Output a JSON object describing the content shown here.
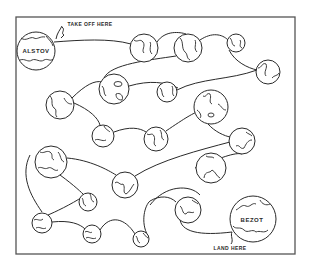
{
  "puzzle": {
    "type": "space maze",
    "start_label": "TAKE OFF HERE",
    "end_label": "LAND HERE",
    "start_planet": "ALSTOV",
    "end_planet": "BEZOT"
  },
  "planets": [
    {
      "id": "p1",
      "name": "ALSTOV",
      "role": "start"
    },
    {
      "id": "p2",
      "name": ""
    },
    {
      "id": "p3",
      "name": ""
    },
    {
      "id": "p4",
      "name": ""
    },
    {
      "id": "p5",
      "name": ""
    },
    {
      "id": "p6",
      "name": ""
    },
    {
      "id": "p7",
      "name": ""
    },
    {
      "id": "p8",
      "name": ""
    },
    {
      "id": "p9",
      "name": ""
    },
    {
      "id": "p10",
      "name": ""
    },
    {
      "id": "p11",
      "name": ""
    },
    {
      "id": "p12",
      "name": ""
    },
    {
      "id": "p13",
      "name": ""
    },
    {
      "id": "p14",
      "name": ""
    },
    {
      "id": "p15",
      "name": ""
    },
    {
      "id": "p16",
      "name": ""
    },
    {
      "id": "p17",
      "name": ""
    },
    {
      "id": "p18",
      "name": ""
    },
    {
      "id": "p19",
      "name": ""
    },
    {
      "id": "p20",
      "name": ""
    },
    {
      "id": "p21",
      "name": "BEZOT",
      "role": "end"
    }
  ],
  "connections": [
    [
      "p1",
      "p2"
    ],
    [
      "p2",
      "p3"
    ],
    [
      "p3",
      "p4"
    ],
    [
      "p4",
      "p5"
    ],
    [
      "p6",
      "p7"
    ],
    [
      "p7",
      "p3"
    ],
    [
      "p6",
      "p5"
    ],
    [
      "p7",
      "p8"
    ],
    [
      "p6",
      "p9"
    ],
    [
      "p9",
      "p10"
    ],
    [
      "p10",
      "p11"
    ],
    [
      "p11",
      "p12"
    ],
    [
      "p13",
      "p14"
    ],
    [
      "p14",
      "p12"
    ],
    [
      "p13",
      "p15"
    ],
    [
      "p15",
      "p12"
    ],
    [
      "p13",
      "p16"
    ],
    [
      "p16",
      "p17"
    ],
    [
      "p17",
      "p18"
    ],
    [
      "p18",
      "p20"
    ],
    [
      "p20",
      "p19"
    ],
    [
      "p19",
      "p21"
    ]
  ]
}
